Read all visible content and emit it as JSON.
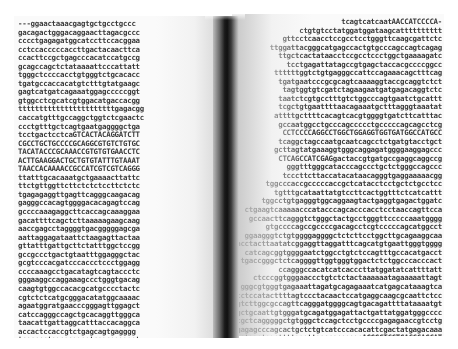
{
  "scene": {
    "description": "Photograph of an open book printed with DNA nucleotide sequences",
    "background_color": "#ffffff",
    "spine_color": "#111111",
    "text_color": "#3a3a3a"
  },
  "left_page": {
    "lines": [
      "---ggaactaaacgagtgctgcctgccc",
      "gacagactgggacaggaacttagacgccc",
      "cccctgagagatggcatccttccacggaa",
      "cctccacccccaccttgactacaacttca",
      "ccacttccgctgagcccacatccatgccg",
      "gcagccagctctataaaattcccattatt",
      "tgggctccccacctgtgggtctgcacacc",
      "tgatgccaccacatgtctttgtatgaagc",
      "gagtcatgatcagaaatggagcccccggt",
      "gtggcctcgcatcgtggacatgaccacgg",
      "tttttttttttttttttttttttgagacgg",
      "caccatgtttgccaggctggtctcgaactc",
      "ccctgtttgctcagtgaatgaggggctga",
      "tcctgactcctcaGTCACTACAGGATCTT",
      "CGCCTGCTGCCCCGCAGGCGTGTCTGTGC",
      "TACATACCCGCAAACCGTGTGTGAACCTC",
      "ACTTGAAGGACTGCTGTGTATTTGTAAAT",
      "TAACCACAAAACCGCCATCGTCGTCAGGG",
      "ttatttgcacaaatgctgaaaacttattc",
      "ttctgttggttcttctctctccttctctc",
      "tgagagaggttgagttcagggcaagacag",
      "gagggccacagtggggacacagagtccag",
      "gccccaaagaggcttcaccagcaaaggaa",
      "gacattttcagctcttaaaaagaagcaag",
      "aaccgagcctaggggtgacgggggagcga",
      "aattaggagataattctaagagttactaa",
      "gttatttgattgcttctatttggctccgg",
      "gccgccctgactgtaatttggagggctac",
      "gcgtcccacgatcccaccctccctggagg",
      "ccccaaagcctgacatagtcagtaccctc",
      "gggaaggccaggaaagccctgggtgacag",
      "caagtgtggccacacgcatgcccctactc",
      "cgtctctcatgcgggacatatggcaaaac",
      "agaatggratgaacccgggagttggagct",
      "catccagggccagctgcacaggttgggca",
      "taacattgattaggcatttaccacaggca",
      "accactccaccgtctgagcagtgagggg",
      "tcacccctagagaggaatcagcgggggat"
    ]
  },
  "right_page": {
    "lines": [
      "tcagtcatcaatAACCATCCCCA-",
      "ctgtgtcctatggatggataagcatttttttttt",
      "gttcctcaacctccgcctcctgggttcaagcgattctc",
      "ttggattacgggcatgagccactgtgcccagccagtcagag",
      "ttgctcactataacctccgcctccctggctgaaaagatc",
      "tcctgagattatagccgtgagctaccacgccccggcc",
      "ttttttggtctgtgagggccattccagaaacagctttcag",
      "tgatgaatcccgcgcagtcaaaaggtaccgcaggtctct",
      "tagtggtgtcgatctagaagaatgatgagacaggtctc",
      "taatctcgtgcctttgtctggcccagtgaatctgcattt",
      "tcgctgtgaattttaacagaaatgctttagggtaaatat",
      "attttgcttttcacagtcacgtggggtgatcttcatttac",
      "gccaatggcctgcccagccccctgcccccagcagcctcg",
      "CCTCCCCAGGCCTGGCTGGAGGTGGTGATGGCCATGCC",
      "tcaggctagccaatgcaatcagcctctgatgtacctgct",
      "gcttagtatgaaaggtgggcaggagatggggaaggagccc",
      "CTCAGCCATCGAGgactaccgtgatgccgaggcaggccg",
      "gggtttgggcatacccagccctgctctgggccagccc",
      "tcccttcttaccatacataacagggtgaggaaaaacgg",
      "tggcccaccgcccccaccgctcatacctcctgctctgcctcc",
      "tgtttgcataattatgtccttcactggtttctcatcattt",
      "tggcctgtgagggtggcaggaagtactgaggtgagactggatc",
      "ctgaagtcaaaaacccatacccagcacccacctcctaaccagttcca",
      "gccaacttcagggtctgggctactgcctgggttcccccaaatgggg",
      "gtgccccagccgccccgacagcctcgtcccccagcatggcct",
      "ggaagggtctgtggggaggggctctcttcctggcttgcagaaggcaa",
      "gggacctacttaatatcggaggttaggatttcagcatgtgaattgggtgggg",
      "catcagcggtggggaatctggcctgtctccagtttgccacatgacct",
      "tgaccgggctctcaggggttggtgggtggactctctggcccacccact",
      "ccagggccacatcatcacccttatggatatcattttatt",
      "ctcccggtgggaaccctgtctctactaaaaaatagaaaaattagt",
      "gggcgtgggtgagaaattagatgcagagaaatcatgagcataaagtca",
      "aggcctccatacttttagtccctacaactccatgaggcaagcgcaattctcc",
      "tccagtcttggcgccagttcagggatggggcagtgacagattttataaaatgt",
      "cccatgatgctgcaattgtgggatgcagatggagattactgattatggatgggcccc",
      "tggtgctcagggggctgtgggctccagctcctgccccgagagaaccgtcctg",
      "agccagggatgagagcccagcactgctctgtcatcccacacattcgactatgagacaaa",
      "agatcgtgatggatagcttttgggttggacacagagaAGGGCTCCTGACCCAGCAT",
      "TCAAGGCCCAGACAGAGCAAGCTCAAGCCC"
    ]
  }
}
